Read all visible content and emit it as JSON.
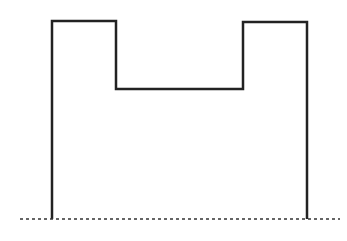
{
  "diagram": {
    "type": "step-outline",
    "outline_points": [
      [
        52,
        219
      ],
      [
        52,
        21
      ],
      [
        116,
        21
      ],
      [
        116,
        89
      ],
      [
        243,
        89
      ],
      [
        243,
        22
      ],
      [
        307,
        22
      ],
      [
        307,
        219
      ]
    ],
    "baseline": {
      "x1": 20,
      "y1": 219,
      "x2": 340,
      "y2": 219,
      "style": "dotted"
    },
    "colors": {
      "stroke": "#222222",
      "baseline": "#333333",
      "background": "#ffffff"
    },
    "stroke_width": 2.5
  }
}
